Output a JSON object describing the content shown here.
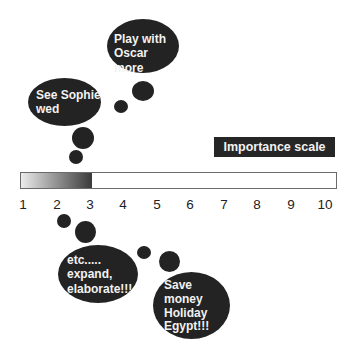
{
  "bubbles": [
    {
      "id": "see-sophie",
      "text": "See Sophie\nwed"
    },
    {
      "id": "play-oscar",
      "text": "Play with\nOscar more"
    },
    {
      "id": "etc",
      "text": "etc.....\nexpand,\nelaborate!!!"
    },
    {
      "id": "save-money",
      "text": "Save\nmoney\nHoliday\nEgypt!!!"
    }
  ],
  "scale": {
    "label": "Importance scale",
    "min": 1,
    "max": 10,
    "filled_to": 3,
    "ticks": [
      "1",
      "2",
      "3",
      "4",
      "5",
      "6",
      "7",
      "8",
      "9",
      "10"
    ],
    "fill_gradient": [
      "#ececec",
      "#3a3a3a"
    ]
  },
  "colors": {
    "bubble": "#232323",
    "bubble_text": "#f2f2f2",
    "bar_border": "#6a6a6a"
  }
}
